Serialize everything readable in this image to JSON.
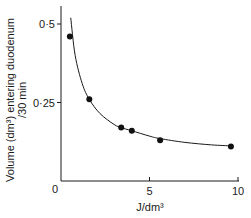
{
  "chart_data": {
    "type": "scatter",
    "title": "",
    "xlabel": "J/dm³",
    "ylabel_line1": "Volume (dm³) entering duodenum",
    "ylabel_line2": "/30 min",
    "xlim": [
      0,
      10
    ],
    "ylim": [
      0,
      0.55
    ],
    "x_ticks": [
      0,
      5,
      10
    ],
    "x_tick_labels": [
      "0",
      "5",
      "10"
    ],
    "y_ticks": [
      0.25,
      0.5
    ],
    "y_tick_labels": [
      "0·25",
      "0·5"
    ],
    "grid": false,
    "legend": null,
    "series": [
      {
        "name": "measured",
        "marker": "filled-circle",
        "x": [
          0.5,
          1.6,
          3.4,
          4.0,
          5.6,
          9.6
        ],
        "y": [
          0.46,
          0.26,
          0.17,
          0.16,
          0.13,
          0.11
        ]
      }
    ],
    "fit_curve": {
      "description": "smooth decreasing hyperbolic fit through points",
      "x": [
        0.55,
        0.8,
        1.2,
        1.6,
        2.2,
        3.0,
        3.4,
        4.0,
        5.0,
        5.6,
        7.0,
        8.5,
        9.6
      ],
      "y": [
        0.52,
        0.4,
        0.31,
        0.26,
        0.215,
        0.18,
        0.17,
        0.16,
        0.143,
        0.135,
        0.123,
        0.115,
        0.112
      ]
    }
  }
}
